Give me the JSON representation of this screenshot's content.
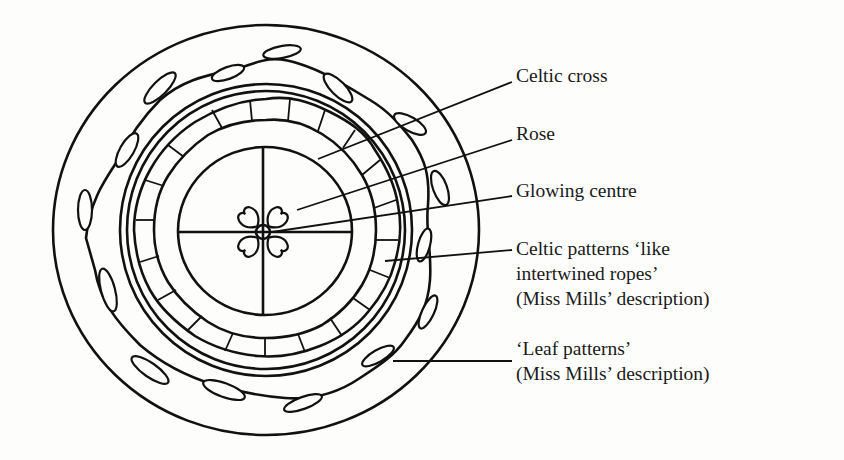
{
  "figure": {
    "type": "annotated-drawing",
    "ink_color": "#111111",
    "background_color": "#fdfdfc"
  },
  "labels": [
    {
      "id": "celtic-cross",
      "lines": [
        "Celtic cross"
      ]
    },
    {
      "id": "rose",
      "lines": [
        "Rose"
      ]
    },
    {
      "id": "glowing-centre",
      "lines": [
        "Glowing centre"
      ]
    },
    {
      "id": "celtic-patterns",
      "lines": [
        "Celtic patterns ‘like",
        "intertwined ropes’",
        "(Miss Mills’ description)"
      ]
    },
    {
      "id": "leaf-patterns",
      "lines": [
        "‘Leaf patterns’",
        "(Miss Mills’ description)"
      ]
    }
  ],
  "parts": {
    "outer_rim": "outer circle",
    "leaf_band": "vine with 15 leaves",
    "double_ring": "two concentric rings",
    "rope_band": "intertwined rope pattern",
    "cross_circle": "circle with cross (four quadrants)",
    "rose": "four heart-shaped petals",
    "centre": "small circle at centre"
  }
}
